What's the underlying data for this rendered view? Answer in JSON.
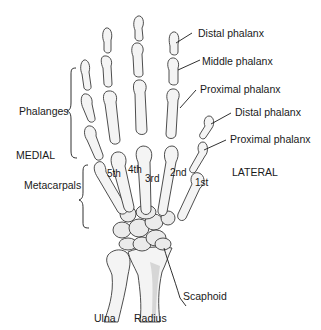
{
  "figure": {
    "orientation": {
      "medial": "MEDIAL",
      "lateral": "LATERAL"
    },
    "group_labels": {
      "phalanges": "Phalanges",
      "metacarpals": "Metacarpals"
    },
    "bone_labels": {
      "distal_phalanx_finger": "Distal phalanx",
      "middle_phalanx": "Middle phalanx",
      "proximal_phalanx_finger": "Proximal phalanx",
      "distal_phalanx_thumb": "Distal phalanx",
      "proximal_phalanx_thumb": "Proximal phalanx",
      "scaphoid": "Scaphoid",
      "ulna": "Ulna",
      "radius": "Radius"
    },
    "metacarpal_numbers": [
      "5th",
      "4th",
      "3rd",
      "2nd",
      "1st"
    ],
    "colors": {
      "bone_fill": "#f4f4f4",
      "bone_outline": "#3a3a3a",
      "text": "#1a1a1a",
      "background": "#ffffff"
    }
  }
}
